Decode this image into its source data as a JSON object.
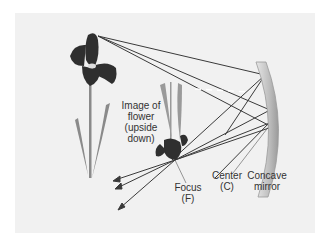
{
  "diagram": {
    "labels": {
      "image_of_flower": [
        "Image of",
        "flower",
        "(upside",
        "down)"
      ],
      "focus": [
        "Focus",
        "(F)"
      ],
      "center": [
        "Center",
        "(C)"
      ],
      "mirror": [
        "Concave",
        "mirror"
      ]
    },
    "colors": {
      "background_panel": "#f1f1f1",
      "ray": "#3a3a3a",
      "flower_petal": "#2f2f2f",
      "stem": "#8a8a8a",
      "mirror": "#c8c8c8"
    }
  }
}
